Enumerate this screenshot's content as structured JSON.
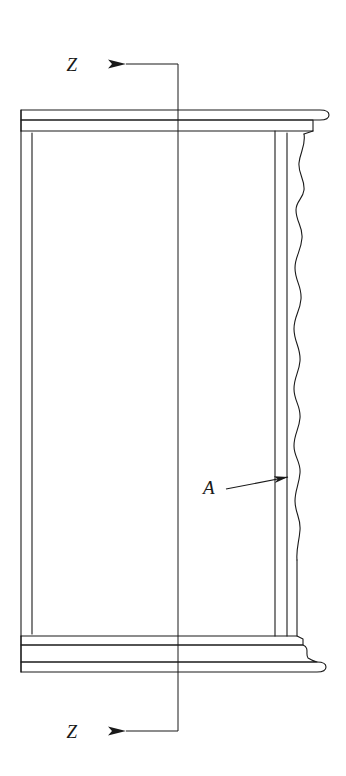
{
  "drawing": {
    "title": "Cylinder liner longitudinal section",
    "type": "engineering-cross-section",
    "background_color": "#ffffff",
    "line_color": "#1a1a1a",
    "line_width": 1.1,
    "canvas": {
      "width": 346,
      "height": 776
    },
    "section_marks": [
      {
        "id": "section-z-top",
        "label": "Z",
        "label_x": 72,
        "label_y": 71,
        "arrow_direction": "left",
        "arrow_tip_x": 108,
        "arrow_tail_x": 150,
        "arrow_y": 64,
        "leader_corner_x": 178,
        "leader_corner_y": 64
      },
      {
        "id": "section-z-bottom",
        "label": "Z",
        "label_x": 72,
        "label_y": 738,
        "arrow_direction": "left",
        "arrow_tip_x": 108,
        "arrow_tail_x": 150,
        "arrow_y": 731,
        "leader_corner_x": 178,
        "leader_corner_y": 731
      }
    ],
    "detail_callouts": [
      {
        "id": "detail-a",
        "label": "A",
        "label_x": 209,
        "label_y": 494,
        "leader_start_x": 226,
        "leader_start_y": 489,
        "arrow_tip_x": 292,
        "arrow_tip_y": 477
      }
    ],
    "centerline": {
      "x": 178,
      "top_y": 64,
      "bottom_y": 731
    },
    "body": {
      "outer_left_x": 21,
      "inner_left_x": 32,
      "inner_right_x": 275,
      "outer_right_x": 297,
      "flange_right_x": 328,
      "top_flange_top_y": 110,
      "top_flange_mid_y": 120,
      "top_flange_bottom_y": 131,
      "body_top_y": 131,
      "body_bottom_y": 636,
      "bottom_band_1_y": 645,
      "bottom_band_2_y": 662,
      "bottom_band_3_y": 671,
      "wavy_top_y": 134,
      "wavy_bottom_y": 560,
      "wavy_base_x": 297,
      "wavy_amplitude": 9
    }
  }
}
